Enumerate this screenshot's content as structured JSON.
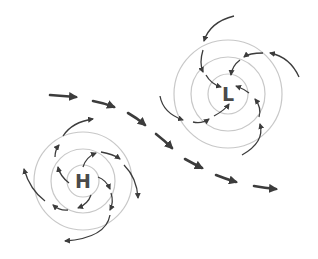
{
  "diagram": {
    "high_pressure": {
      "label": "H",
      "center": [
        83,
        181
      ],
      "isobar_radii": [
        16,
        32,
        48
      ]
    },
    "low_pressure": {
      "label": "L",
      "center": [
        228,
        94
      ],
      "isobar_radii": [
        20,
        37,
        53
      ]
    },
    "jet_stream": {
      "description": "dashed arrows flowing left to right between the systems"
    },
    "colors": {
      "isobar": "#c8c8c8",
      "arrow": "#3c3c3c",
      "label": "#4a4a4a",
      "background": "#ffffff"
    }
  }
}
